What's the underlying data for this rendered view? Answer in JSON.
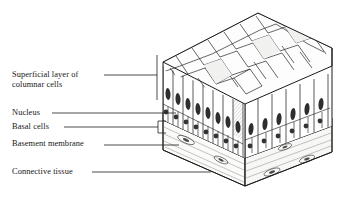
{
  "figure": {
    "kind": "histology-illustration",
    "style": "pen-and-ink line drawing, three-quarter cutaway block",
    "background_color": "#ffffff",
    "ink_color": "#1f1f1f",
    "leader_color": "#2b2b2b"
  },
  "labels": [
    {
      "id": "superficial-columnar",
      "text": "Superficial layer of\ncolumnar cells",
      "x": 12,
      "y": 70,
      "leader": {
        "from_x": 104,
        "from_y": 75,
        "to_x": 157,
        "to_y": 75
      },
      "bracket": {
        "x": 157,
        "y1": 55,
        "y2": 100
      }
    },
    {
      "id": "nucleus",
      "text": "Nucleus",
      "x": 12,
      "y": 108,
      "leader": {
        "from_x": 52,
        "from_y": 113,
        "to_x": 176,
        "to_y": 113
      },
      "bracket": null
    },
    {
      "id": "basal-cells",
      "text": "Basal cells",
      "x": 12,
      "y": 122,
      "leader": {
        "from_x": 64,
        "from_y": 127,
        "to_x": 158,
        "to_y": 127
      },
      "bracket": {
        "x": 158,
        "y1": 121,
        "y2": 133,
        "tick_x": 166
      }
    },
    {
      "id": "basement-membrane",
      "text": "Basement membrane",
      "x": 12,
      "y": 139,
      "leader": {
        "from_x": 104,
        "from_y": 145,
        "to_x": 179,
        "to_y": 145
      },
      "bracket": null
    },
    {
      "id": "connective-tissue",
      "text": "Connective tissue",
      "x": 12,
      "y": 167,
      "leader": {
        "from_x": 92,
        "from_y": 172,
        "to_x": 211,
        "to_y": 172
      },
      "bracket": null
    }
  ],
  "tissue_layers": [
    {
      "name": "apical free surface",
      "description": "mosaic of irregular polygonal cell apices seen from above"
    },
    {
      "name": "columnar cell layer",
      "description": "tall narrow cells with elongated dark oval nuclei"
    },
    {
      "name": "basal cell layer",
      "description": "small rounded cells with round nuclei"
    },
    {
      "name": "basement membrane",
      "description": "thin hatched band beneath epithelium"
    },
    {
      "name": "connective tissue",
      "description": "pale fibrous base with scattered elongate fibroblast nuclei"
    }
  ]
}
